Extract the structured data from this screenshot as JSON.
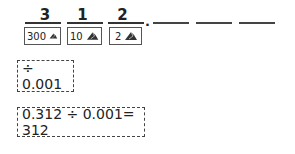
{
  "digits": [
    {
      "value": "3",
      "place_label": "300"
    },
    {
      "value": "1",
      "place_label": "10"
    },
    {
      "value": "2",
      "place_label": "2"
    }
  ],
  "decimal_point": ".",
  "blanks": 3,
  "divisor_box": "÷ 0.001",
  "equation_box": "0.312 ÷ 0.001= 312",
  "icon": "pile-icon"
}
